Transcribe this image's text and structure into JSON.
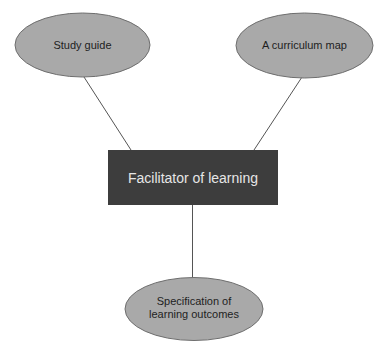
{
  "diagram": {
    "type": "concept-map",
    "colors": {
      "background": "#ffffff",
      "ellipse_fill": "#a9a9a9",
      "ellipse_stroke": "#6e6e6e",
      "box_fill": "#3d3d3d",
      "box_text": "#e6e6e6",
      "node_text": "#1e1e1e",
      "connector": "#555555"
    },
    "center_node": {
      "label": "Facilitator of learning",
      "shape": "rectangle"
    },
    "outer_nodes": [
      {
        "id": "study-guide",
        "label": "Study guide",
        "shape": "ellipse",
        "position": "top-left"
      },
      {
        "id": "curriculum-map",
        "label": "A curriculum map",
        "shape": "ellipse",
        "position": "top-right"
      },
      {
        "id": "learning-outcomes",
        "label": "Specification of learning outcomes",
        "shape": "ellipse",
        "position": "bottom"
      }
    ],
    "edges": [
      {
        "from": "study-guide",
        "to": "center"
      },
      {
        "from": "curriculum-map",
        "to": "center"
      },
      {
        "from": "center",
        "to": "learning-outcomes"
      }
    ]
  }
}
